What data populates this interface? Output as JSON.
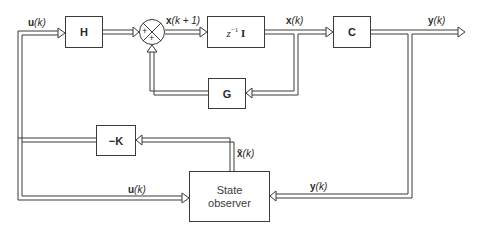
{
  "diagram": {
    "type": "block-diagram",
    "blocks": {
      "H": {
        "label": "H"
      },
      "delay": {
        "label_prefix": "z",
        "label_exp": "−1",
        "label_suffix": "I"
      },
      "C": {
        "label": "C"
      },
      "G": {
        "label": "G"
      },
      "neg_K": {
        "label": "−K"
      },
      "observer": {
        "line1": "State",
        "line2": "observer"
      }
    },
    "summing_junction": {
      "signs": [
        "+",
        "+"
      ]
    },
    "signals": {
      "u_top": {
        "vec": "u",
        "arg": "(k)"
      },
      "x_next": {
        "vec": "x",
        "arg": "(k + 1)"
      },
      "x_k": {
        "vec": "x",
        "arg": "(k)"
      },
      "y_out": {
        "vec": "y",
        "arg": "(k)"
      },
      "x_tilde": {
        "vec": "x̃",
        "arg": "(k)"
      },
      "u_bottom": {
        "vec": "u",
        "arg": "(k)"
      },
      "y_bottom": {
        "vec": "y",
        "arg": "(k)"
      }
    },
    "colors": {
      "line": "#3a3a3a",
      "background": "#ffffff"
    }
  }
}
